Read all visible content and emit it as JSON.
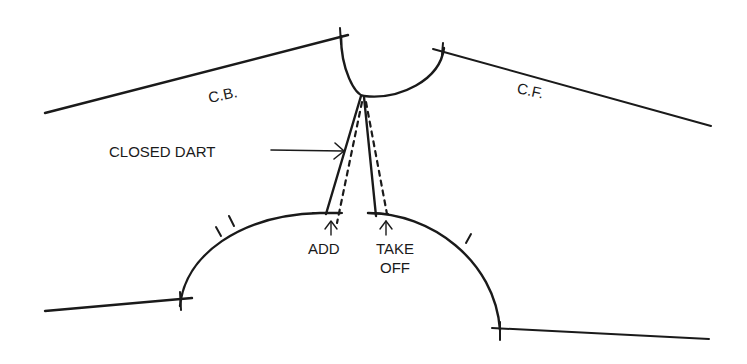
{
  "diagram": {
    "type": "sewing-pattern-neckline-and-armhole-adjustment",
    "stroke_color": "#1a1a1a",
    "background": "#ffffff",
    "labels": {
      "center_back": "C.B.",
      "center_front": "C.F.",
      "closed_dart": "CLOSED DART",
      "add": "ADD",
      "take_off_line1": "TAKE",
      "take_off_line2": "OFF"
    },
    "elements": [
      {
        "name": "center-back-shoulder-line",
        "desc": "Line from left edge up to neckline (C.B.)"
      },
      {
        "name": "center-front-shoulder-line",
        "desc": "Line from neckline down to right edge (C.F.)"
      },
      {
        "name": "neckline-curve",
        "desc": "Semicircular neckline between shoulder lines"
      },
      {
        "name": "closed-dart",
        "desc": "Two solid dart legs with dashed original positions"
      },
      {
        "name": "armhole-curve",
        "desc": "Lower armhole curve with notches"
      },
      {
        "name": "side-seam-lines",
        "desc": "Lines extending from armhole to edges"
      }
    ]
  }
}
